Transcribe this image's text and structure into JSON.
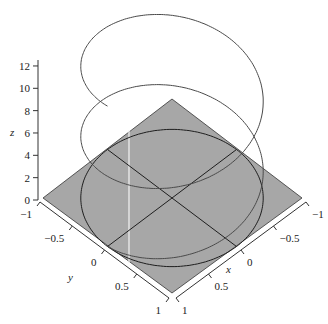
{
  "chart_data": {
    "type": "line3d",
    "title": "",
    "series": [
      {
        "name": "helix",
        "param": "t",
        "t_range": [
          0,
          12.566
        ],
        "x": "cos(t)",
        "y": "sin(t)",
        "z": "t",
        "color": "#4a4a4a"
      },
      {
        "name": "unit-circle-z0",
        "x": "cos(t)",
        "y": "sin(t)",
        "z": 0,
        "color": "#1e1e1e"
      },
      {
        "name": "line-x0",
        "points": [
          [
            0,
            -1,
            0
          ],
          [
            0,
            1,
            0
          ]
        ],
        "color": "#1e1e1e"
      },
      {
        "name": "line-y0",
        "points": [
          [
            -1,
            0,
            0
          ],
          [
            1,
            0,
            0
          ]
        ],
        "color": "#1e1e1e"
      }
    ],
    "plane": {
      "z": 0,
      "x_range": [
        -1,
        1
      ],
      "y_range": [
        -1,
        1
      ],
      "color": "#a7a7a7"
    },
    "xlabel": "x",
    "ylabel": "y",
    "zlabel": "z",
    "xlim": [
      -1,
      1
    ],
    "ylim": [
      -1,
      1
    ],
    "zlim": [
      0,
      12
    ],
    "x_ticks": [
      "-1",
      "-0.5",
      "0",
      "0.5",
      "1"
    ],
    "y_ticks": [
      "-1",
      "-0.5",
      "0",
      "0.5",
      "1"
    ],
    "z_ticks": [
      "0",
      "2",
      "4",
      "6",
      "8",
      "10",
      "12"
    ],
    "grid": false
  },
  "projection": {
    "cx": 172,
    "cy": 198,
    "kx": 64.5,
    "ky": 48.5,
    "kz": 11.17
  }
}
